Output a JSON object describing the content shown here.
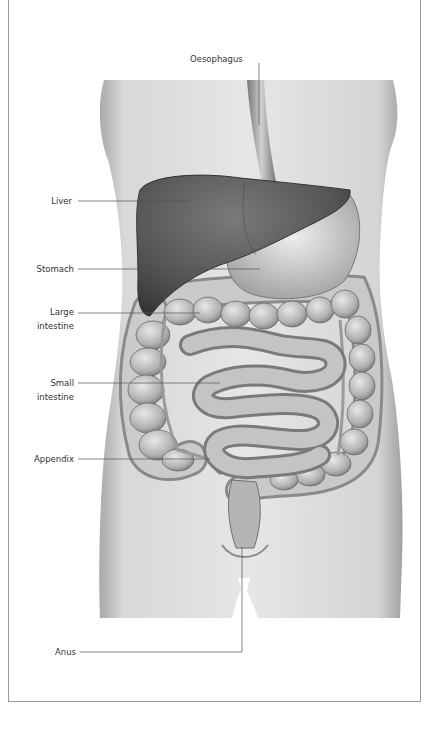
{
  "diagram": {
    "labels": {
      "oesophagus": "Oesophagus",
      "liver": "Liver",
      "stomach": "Stomach",
      "large_intestine_1": "Large",
      "large_intestine_2": "intestine",
      "small_intestine_1": "Small",
      "small_intestine_2": "intestine",
      "appendix": "Appendix",
      "anus": "Anus"
    },
    "colors": {
      "frame": "#9a9a9a",
      "leader_line": "#555555",
      "skin": "#dcdcdc",
      "liver": "#5a5a5a",
      "intestine": "#bdbdbd",
      "text": "#333333"
    }
  }
}
